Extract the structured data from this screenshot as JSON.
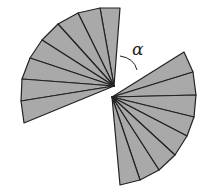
{
  "diagram": {
    "fill_color": "#a9a9a9",
    "stroke_color": "#222222",
    "angle_label": "α",
    "upper_fan": {
      "apex": [
        114,
        86
      ],
      "outer_points": [
        [
          120,
          8
        ],
        [
          100,
          8
        ],
        [
          78,
          13
        ],
        [
          58,
          24
        ],
        [
          42,
          40
        ],
        [
          30,
          58
        ],
        [
          22,
          79
        ],
        [
          21,
          101
        ],
        [
          24,
          123
        ]
      ]
    },
    "lower_fan": {
      "apex": [
        112,
        97
      ],
      "outer_points": [
        [
          184,
          52
        ],
        [
          193,
          72
        ],
        [
          196,
          95
        ],
        [
          194,
          117
        ],
        [
          187,
          136
        ],
        [
          175,
          155
        ],
        [
          159,
          170
        ],
        [
          140,
          180
        ],
        [
          120,
          185
        ]
      ]
    }
  }
}
